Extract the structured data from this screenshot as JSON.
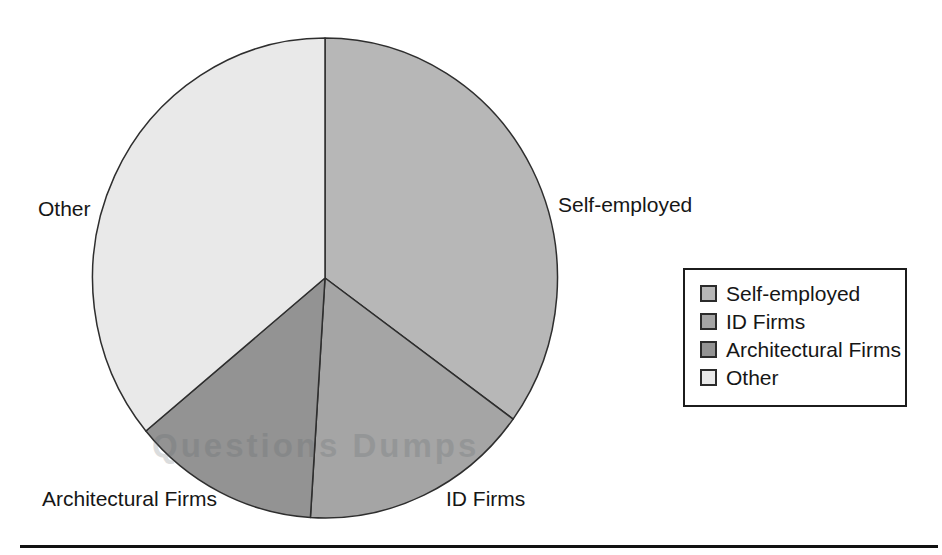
{
  "chart_data": {
    "type": "pie",
    "labels": [
      "Self-employed",
      "ID Firms",
      "Architectural Firms",
      "Other"
    ],
    "values": [
      35,
      16,
      13,
      36
    ],
    "value_unit": "percent",
    "colors": [
      "#b7b7b7",
      "#a5a5a5",
      "#939393",
      "#e9e9e9"
    ],
    "edge_color": "#2e2e2e",
    "start_angle_deg": 0,
    "direction": "clockwise",
    "title": "",
    "legend": {
      "position": "right",
      "entries": [
        "Self-employed",
        "ID Firms",
        "Architectural Firms",
        "Other"
      ]
    }
  },
  "watermark": "Questions Dumps"
}
